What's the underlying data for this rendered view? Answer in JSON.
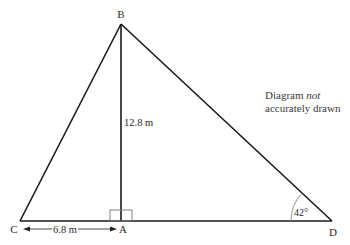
{
  "diagram": {
    "type": "geometry-triangle",
    "points": {
      "B": {
        "label": "B"
      },
      "C": {
        "label": "C"
      },
      "A": {
        "label": "A"
      },
      "D": {
        "label": "D"
      }
    },
    "measurements": {
      "BA": "12.8 m",
      "CA": "6.8 m",
      "angle_D": "42°"
    },
    "right_angle_at": "A",
    "note": {
      "line1_a": "Diagram ",
      "line1_b": "not",
      "line2": "accurately drawn"
    }
  }
}
